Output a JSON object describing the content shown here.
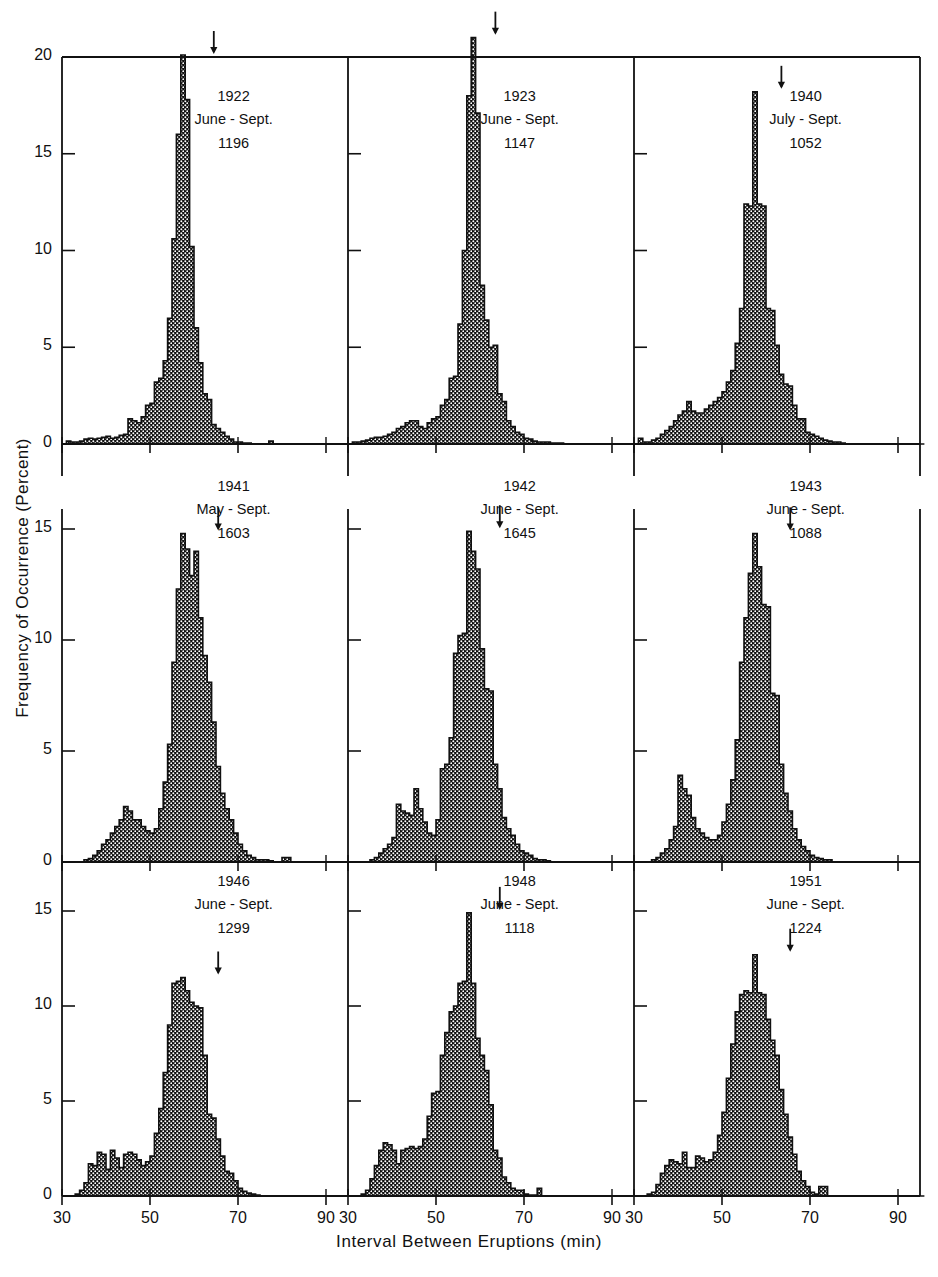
{
  "chart_data": {
    "type": "bar",
    "title": "",
    "subtitle": "",
    "xlabel": "Interval Between Eruptions (min)",
    "ylabel": "Frequency of Occurrence (Percent)",
    "xlim": [
      30,
      95
    ],
    "ylim": [
      0,
      21.5
    ],
    "xticks": [
      30,
      50,
      70,
      90
    ],
    "xtick_labels": [
      "30",
      "50",
      "70",
      "90"
    ],
    "yticks_top": [
      0,
      5,
      10,
      15,
      20
    ],
    "ytick_labels_top": [
      "0",
      "5",
      "10",
      "15",
      "20"
    ],
    "yticks_mid": [
      0,
      5,
      10,
      15
    ],
    "ytick_labels_mid": [
      "0",
      "5",
      "10",
      "15"
    ],
    "yticks_bottom": [
      0,
      5,
      10,
      15
    ],
    "ytick_labels_bottom": [
      "0",
      "5",
      "10",
      "15"
    ],
    "bin_width": 1,
    "grid": false,
    "legend": "none",
    "layout": "3x3 grid of histogram panels",
    "arrow_marker": "mean interval indicator (downward arrow above modal bar)",
    "panels": [
      {
        "row": 0,
        "col": 0,
        "year": "1922",
        "period": "June - Sept.",
        "count": "1196",
        "ymax": 20,
        "arrow_x": 64,
        "bin_start": 31,
        "values": [
          0.15,
          0.1,
          0.1,
          0.15,
          0.25,
          0.3,
          0.25,
          0.3,
          0.35,
          0.4,
          0.3,
          0.35,
          0.45,
          0.5,
          1.3,
          1.2,
          1.1,
          1.4,
          2.0,
          2.1,
          3.2,
          3.4,
          4.3,
          6.5,
          10.6,
          16.0,
          20.1,
          17.8,
          10.2,
          6.0,
          4.2,
          2.6,
          2.3,
          1.0,
          0.8,
          0.6,
          0.4,
          0.25,
          0.1,
          0.1,
          0.05,
          0.05,
          0,
          0,
          0,
          0,
          0.15,
          0,
          0,
          0,
          0,
          0,
          0,
          0,
          0,
          0,
          0,
          0,
          0,
          0,
          0,
          0,
          0,
          0,
          0
        ]
      },
      {
        "row": 0,
        "col": 1,
        "year": "1923",
        "period": "June - Sept.",
        "count": "1147",
        "ymax": 21,
        "arrow_x": 63,
        "bin_start": 31,
        "values": [
          0.1,
          0.1,
          0.15,
          0.2,
          0.3,
          0.35,
          0.35,
          0.4,
          0.5,
          0.6,
          0.8,
          0.9,
          1.1,
          1.2,
          1.2,
          0.9,
          0.8,
          1.1,
          1.3,
          1.4,
          2.0,
          2.3,
          3.4,
          3.5,
          6.2,
          10.0,
          18.0,
          21.0,
          17.1,
          8.2,
          6.4,
          5.0,
          5.1,
          2.6,
          2.2,
          1.2,
          0.9,
          0.6,
          0.5,
          0.3,
          0.25,
          0.15,
          0.1,
          0.1,
          0.1,
          0.05,
          0.05,
          0.05,
          0,
          0,
          0,
          0,
          0,
          0,
          0,
          0,
          0,
          0,
          0,
          0,
          0,
          0,
          0,
          0,
          0
        ]
      },
      {
        "row": 0,
        "col": 2,
        "year": "1940",
        "period": "July - Sept.",
        "count": "1052",
        "ymax": 18.2,
        "arrow_x": 63,
        "bin_start": 31,
        "values": [
          0.3,
          0.1,
          0.1,
          0.2,
          0.3,
          0.5,
          0.7,
          0.9,
          1.2,
          1.5,
          1.7,
          2.2,
          1.7,
          1.6,
          1.6,
          1.8,
          2.0,
          2.2,
          2.4,
          2.7,
          3.2,
          3.8,
          5.2,
          7.0,
          12.4,
          12.3,
          18.2,
          12.4,
          12.3,
          7.0,
          6.9,
          5.1,
          3.6,
          3.1,
          3.0,
          2.0,
          1.3,
          1.3,
          0.6,
          0.5,
          0.4,
          0.3,
          0.2,
          0.15,
          0.1,
          0.1,
          0.05,
          0,
          0,
          0,
          0,
          0,
          0,
          0,
          0,
          0,
          0,
          0,
          0,
          0,
          0,
          0,
          0,
          0,
          0
        ]
      },
      {
        "row": 1,
        "col": 0,
        "year": "1941",
        "period": "May - Sept.",
        "count": "1603",
        "ymax": 14.8,
        "arrow_x": 65,
        "bin_start": 31,
        "values": [
          0,
          0,
          0,
          0,
          0.1,
          0.15,
          0.3,
          0.5,
          0.8,
          1.0,
          1.3,
          1.6,
          1.9,
          2.5,
          2.3,
          1.9,
          1.9,
          1.6,
          1.4,
          1.3,
          1.5,
          2.4,
          3.6,
          5.3,
          9.0,
          12.3,
          14.8,
          14.1,
          12.9,
          14.0,
          11.0,
          9.3,
          8.1,
          6.3,
          4.3,
          3.1,
          2.4,
          1.9,
          1.3,
          0.8,
          0.5,
          0.3,
          0.2,
          0.1,
          0.1,
          0.1,
          0.05,
          0,
          0,
          0.2,
          0.2,
          0,
          0,
          0,
          0,
          0,
          0,
          0,
          0,
          0,
          0,
          0,
          0,
          0,
          0
        ]
      },
      {
        "row": 1,
        "col": 1,
        "year": "1942",
        "period": "June - Sept.",
        "count": "1645",
        "ymax": 14.9,
        "arrow_x": 64,
        "bin_start": 31,
        "values": [
          0,
          0,
          0,
          0,
          0.1,
          0.2,
          0.4,
          0.6,
          0.8,
          1.1,
          2.6,
          2.3,
          2.2,
          2.1,
          3.3,
          2.4,
          1.8,
          1.3,
          1.2,
          1.9,
          4.2,
          4.4,
          5.6,
          9.4,
          10.2,
          10.3,
          14.9,
          14.0,
          13.2,
          9.6,
          7.8,
          7.7,
          4.4,
          3.3,
          2.0,
          1.5,
          1.2,
          0.8,
          0.5,
          0.4,
          0.3,
          0.15,
          0.1,
          0.1,
          0.05,
          0,
          0,
          0,
          0,
          0,
          0,
          0,
          0,
          0,
          0,
          0,
          0,
          0,
          0,
          0,
          0,
          0,
          0,
          0,
          0
        ]
      },
      {
        "row": 1,
        "col": 2,
        "year": "1943",
        "period": "June - Sept.",
        "count": "1088",
        "ymax": 14.8,
        "arrow_x": 65,
        "bin_start": 31,
        "values": [
          0,
          0,
          0,
          0.1,
          0.2,
          0.4,
          0.6,
          1.0,
          1.6,
          3.9,
          3.3,
          3.0,
          2.0,
          1.5,
          1.3,
          1.1,
          1.0,
          1.0,
          1.2,
          1.8,
          2.6,
          3.7,
          5.5,
          9.0,
          11.0,
          13.0,
          14.8,
          13.3,
          11.6,
          11.5,
          7.6,
          7.5,
          4.4,
          3.1,
          2.3,
          1.5,
          1.0,
          0.7,
          0.5,
          0.3,
          0.2,
          0.15,
          0.1,
          0.1,
          0,
          0,
          0,
          0,
          0,
          0,
          0,
          0,
          0,
          0,
          0,
          0,
          0,
          0,
          0,
          0,
          0,
          0,
          0,
          0
        ]
      },
      {
        "row": 2,
        "col": 0,
        "year": "1946",
        "period": "June - Sept.",
        "count": "1299",
        "ymax": 11.5,
        "arrow_x": 65,
        "bin_start": 31,
        "values": [
          0,
          0,
          0.1,
          0.3,
          0.7,
          1.7,
          1.6,
          2.3,
          2.2,
          1.4,
          2.4,
          2.0,
          1.5,
          2.2,
          2.3,
          2.2,
          1.9,
          1.6,
          1.8,
          2.1,
          3.3,
          4.6,
          6.5,
          9.0,
          11.2,
          11.3,
          11.5,
          10.8,
          10.2,
          10.0,
          9.9,
          7.4,
          4.3,
          4.1,
          3.0,
          2.1,
          1.3,
          1.2,
          0.8,
          0.4,
          0.25,
          0.15,
          0.1,
          0.05,
          0,
          0,
          0,
          0,
          0,
          0,
          0,
          0,
          0,
          0,
          0,
          0,
          0,
          0,
          0,
          0,
          0,
          0,
          0,
          0
        ]
      },
      {
        "row": 2,
        "col": 1,
        "year": "1948",
        "period": "June - Sept.",
        "count": "1118",
        "ymax": 14.9,
        "arrow_x": 64,
        "bin_start": 31,
        "values": [
          0,
          0,
          0.1,
          0.3,
          0.9,
          1.6,
          2.4,
          2.8,
          2.7,
          2.4,
          1.7,
          2.4,
          2.5,
          2.6,
          2.5,
          2.6,
          3.0,
          4.2,
          5.4,
          5.5,
          7.4,
          8.6,
          9.7,
          10.0,
          11.2,
          11.3,
          14.9,
          11.2,
          8.3,
          7.4,
          6.6,
          4.8,
          2.4,
          2.0,
          1.0,
          0.7,
          0.4,
          0.3,
          0.3,
          0.1,
          0.05,
          0.05,
          0.4,
          0,
          0,
          0,
          0,
          0,
          0,
          0,
          0,
          0,
          0,
          0,
          0,
          0,
          0,
          0,
          0,
          0,
          0,
          0,
          0,
          0
        ]
      },
      {
        "row": 2,
        "col": 2,
        "year": "1951",
        "period": "June - Sept.",
        "count": "1224",
        "ymax": 12.7,
        "arrow_x": 65,
        "bin_start": 31,
        "values": [
          0,
          0,
          0.1,
          0.2,
          0.6,
          1.2,
          1.6,
          1.9,
          1.8,
          1.7,
          2.3,
          1.5,
          1.5,
          2.1,
          2.0,
          1.8,
          1.9,
          2.3,
          3.2,
          4.4,
          6.2,
          8.0,
          9.7,
          10.6,
          10.8,
          10.7,
          12.7,
          10.7,
          10.6,
          9.3,
          8.2,
          7.4,
          5.6,
          4.3,
          3.1,
          2.2,
          1.3,
          0.8,
          0.5,
          0.2,
          0.1,
          0.5,
          0.5,
          0,
          0,
          0,
          0,
          0,
          0,
          0,
          0,
          0,
          0,
          0,
          0,
          0,
          0,
          0,
          0,
          0,
          0,
          0,
          0,
          0,
          0
        ]
      }
    ]
  },
  "axis": {
    "ylabel": "Frequency of Occurrence (Percent)",
    "xlabel": "Interval Between Eruptions (min)"
  },
  "colors": {
    "ink": "#111111",
    "fill": "#1a1a1a",
    "background": "#ffffff"
  }
}
